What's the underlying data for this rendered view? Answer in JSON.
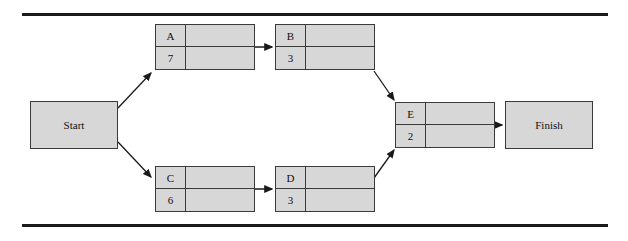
{
  "diagram": {
    "colors": {
      "node_fill": "#d7d7d7",
      "node_border": "#3a3a3a",
      "connector": "#1a1a1a",
      "rule": "#1a1a1a",
      "page_background": "#ffffff"
    },
    "terminals": [
      {
        "id": "start",
        "label": "Start",
        "x": 30,
        "y": 101,
        "w": 88,
        "h": 48
      },
      {
        "id": "finish",
        "label": "Finish",
        "x": 505,
        "y": 101,
        "w": 88,
        "h": 48
      }
    ],
    "nodes": [
      {
        "id": "a",
        "label": "A",
        "duration": "7",
        "x": 155,
        "y": 24,
        "w": 100,
        "h": 46
      },
      {
        "id": "b",
        "label": "B",
        "duration": "3",
        "x": 275,
        "y": 24,
        "w": 100,
        "h": 46
      },
      {
        "id": "c",
        "label": "C",
        "duration": "6",
        "x": 155,
        "y": 166,
        "w": 100,
        "h": 46
      },
      {
        "id": "d",
        "label": "D",
        "duration": "3",
        "x": 275,
        "y": 166,
        "w": 100,
        "h": 46
      },
      {
        "id": "e",
        "label": "E",
        "duration": "2",
        "x": 395,
        "y": 102,
        "w": 100,
        "h": 46
      }
    ],
    "connectors": [
      {
        "id": "start-to-a",
        "from": "start",
        "to": "a",
        "kind": "diagonal-up",
        "x1": 118,
        "y1": 108,
        "x2": 153,
        "y2": 72
      },
      {
        "id": "start-to-c",
        "from": "start",
        "to": "c",
        "kind": "diagonal-down",
        "x1": 118,
        "y1": 142,
        "x2": 153,
        "y2": 178
      },
      {
        "id": "a-to-b",
        "from": "a",
        "to": "b",
        "kind": "horizontal",
        "x1": 155,
        "y1": 47,
        "x2": 273,
        "y2": 47
      },
      {
        "id": "c-to-d",
        "from": "c",
        "to": "d",
        "kind": "horizontal",
        "x1": 155,
        "y1": 189,
        "x2": 273,
        "y2": 189
      },
      {
        "id": "b-to-e",
        "from": "b",
        "to": "e",
        "kind": "diagonal-down",
        "x1": 375,
        "y1": 71,
        "x2": 396,
        "y2": 101
      },
      {
        "id": "d-to-e",
        "from": "d",
        "to": "e",
        "kind": "diagonal-up",
        "x1": 375,
        "y1": 178,
        "x2": 396,
        "y2": 149
      },
      {
        "id": "e-to-finish",
        "from": "e",
        "to": "finish",
        "kind": "horizontal",
        "x1": 395,
        "y1": 125,
        "x2": 503,
        "y2": 125
      }
    ],
    "rules": [
      {
        "id": "rule-top",
        "y": 13
      },
      {
        "id": "rule-bottom",
        "y": 224
      }
    ]
  }
}
